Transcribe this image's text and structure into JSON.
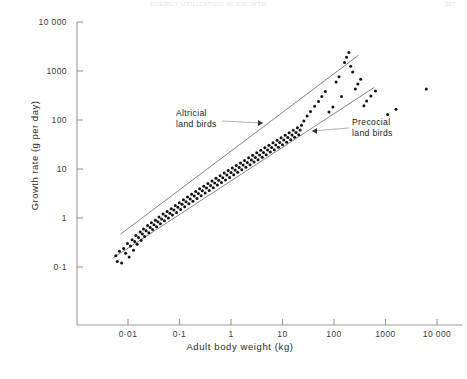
{
  "page": {
    "running_head": "ENERGY UTILIZATION IN GROWTH",
    "page_number": "227"
  },
  "chart_data": {
    "type": "scatter",
    "title": "",
    "xlabel": "Adult body weight (kg)",
    "ylabel": "Growth rate (g per day)",
    "xscale": "log",
    "yscale": "log",
    "xlim": [
      0.003,
      20000
    ],
    "ylim": [
      0.06,
      10000
    ],
    "grid": false,
    "legend": "none",
    "xticks": [
      "0·01",
      "0·1",
      "1",
      "10",
      "100",
      "1000",
      "10 000"
    ],
    "xtick_values": [
      0.01,
      0.1,
      1,
      10,
      100,
      1000,
      10000
    ],
    "yticks": [
      "0·1",
      "1",
      "10",
      "100",
      "1000",
      "10 000"
    ],
    "ytick_values": [
      0.1,
      1,
      10,
      100,
      1000,
      10000
    ],
    "annotations": [
      {
        "label": "Altricial\nland birds",
        "line1": "Altricial",
        "line2": "land birds",
        "target_series": "altricial-fit-line"
      },
      {
        "label": "Precocial\nland birds",
        "line1": "Precocial",
        "line2": "land birds",
        "target_series": "precocial-fit-line"
      }
    ],
    "series": [
      {
        "name": "Altricial land birds fit",
        "type": "line",
        "x": [
          0.0072,
          300
        ],
        "y": [
          0.47,
          2100
        ]
      },
      {
        "name": "Precocial land birds fit",
        "type": "line",
        "x": [
          0.0052,
          600
        ],
        "y": [
          0.155,
          460
        ]
      },
      {
        "name": "Bird species",
        "type": "scatter",
        "marker": "filled-circle",
        "n_points": 162,
        "points": [
          [
            0.0058,
            0.17
          ],
          [
            0.0062,
            0.13
          ],
          [
            0.0068,
            0.21
          ],
          [
            0.0075,
            0.12
          ],
          [
            0.0082,
            0.24
          ],
          [
            0.009,
            0.19
          ],
          [
            0.0098,
            0.3
          ],
          [
            0.0105,
            0.16
          ],
          [
            0.0112,
            0.27
          ],
          [
            0.012,
            0.36
          ],
          [
            0.0128,
            0.22
          ],
          [
            0.0135,
            0.33
          ],
          [
            0.0142,
            0.44
          ],
          [
            0.015,
            0.29
          ],
          [
            0.016,
            0.4
          ],
          [
            0.0172,
            0.52
          ],
          [
            0.018,
            0.35
          ],
          [
            0.019,
            0.47
          ],
          [
            0.02,
            0.6
          ],
          [
            0.021,
            0.42
          ],
          [
            0.0225,
            0.55
          ],
          [
            0.024,
            0.7
          ],
          [
            0.0255,
            0.5
          ],
          [
            0.027,
            0.64
          ],
          [
            0.0285,
            0.8
          ],
          [
            0.03,
            0.58
          ],
          [
            0.032,
            0.73
          ],
          [
            0.034,
            0.9
          ],
          [
            0.036,
            0.66
          ],
          [
            0.038,
            0.84
          ],
          [
            0.04,
            1.05
          ],
          [
            0.0425,
            0.76
          ],
          [
            0.045,
            0.95
          ],
          [
            0.048,
            1.2
          ],
          [
            0.051,
            0.88
          ],
          [
            0.054,
            1.1
          ],
          [
            0.0575,
            1.35
          ],
          [
            0.061,
            1.0
          ],
          [
            0.065,
            1.25
          ],
          [
            0.069,
            1.55
          ],
          [
            0.073,
            1.15
          ],
          [
            0.078,
            1.45
          ],
          [
            0.083,
            1.8
          ],
          [
            0.088,
            1.3
          ],
          [
            0.093,
            1.65
          ],
          [
            0.099,
            2.05
          ],
          [
            0.105,
            1.5
          ],
          [
            0.112,
            1.9
          ],
          [
            0.119,
            2.35
          ],
          [
            0.126,
            1.7
          ],
          [
            0.134,
            2.15
          ],
          [
            0.143,
            2.7
          ],
          [
            0.152,
            1.95
          ],
          [
            0.161,
            2.45
          ],
          [
            0.172,
            3.05
          ],
          [
            0.182,
            2.2
          ],
          [
            0.194,
            2.8
          ],
          [
            0.206,
            3.45
          ],
          [
            0.219,
            2.5
          ],
          [
            0.233,
            3.15
          ],
          [
            0.247,
            3.95
          ],
          [
            0.263,
            2.85
          ],
          [
            0.279,
            3.6
          ],
          [
            0.297,
            4.45
          ],
          [
            0.315,
            3.25
          ],
          [
            0.335,
            4.1
          ],
          [
            0.356,
            5.05
          ],
          [
            0.378,
            3.65
          ],
          [
            0.402,
            4.6
          ],
          [
            0.427,
            5.7
          ],
          [
            0.454,
            4.15
          ],
          [
            0.482,
            5.2
          ],
          [
            0.512,
            6.45
          ],
          [
            0.544,
            4.7
          ],
          [
            0.578,
            5.9
          ],
          [
            0.614,
            7.3
          ],
          [
            0.653,
            5.3
          ],
          [
            0.693,
            6.65
          ],
          [
            0.737,
            8.25
          ],
          [
            0.783,
            6.0
          ],
          [
            0.832,
            7.5
          ],
          [
            0.884,
            9.3
          ],
          [
            0.939,
            6.75
          ],
          [
            0.998,
            8.45
          ],
          [
            1.06,
            10.5
          ],
          [
            1.13,
            7.6
          ],
          [
            1.2,
            9.5
          ],
          [
            1.27,
            11.8
          ],
          [
            1.35,
            8.55
          ],
          [
            1.44,
            10.7
          ],
          [
            1.53,
            13.3
          ],
          [
            1.62,
            9.65
          ],
          [
            1.72,
            12.1
          ],
          [
            1.83,
            15.0
          ],
          [
            1.95,
            10.9
          ],
          [
            2.07,
            13.6
          ],
          [
            2.2,
            16.9
          ],
          [
            2.34,
            12.2
          ],
          [
            2.48,
            15.3
          ],
          [
            2.64,
            19.0
          ],
          [
            2.8,
            13.8
          ],
          [
            2.98,
            17.2
          ],
          [
            3.16,
            21.4
          ],
          [
            3.36,
            15.5
          ],
          [
            3.57,
            19.4
          ],
          [
            3.79,
            24.1
          ],
          [
            4.03,
            17.4
          ],
          [
            4.28,
            21.8
          ],
          [
            4.55,
            27.1
          ],
          [
            4.83,
            19.6
          ],
          [
            5.13,
            24.5
          ],
          [
            5.45,
            30.5
          ],
          [
            5.79,
            22.1
          ],
          [
            6.15,
            27.6
          ],
          [
            6.54,
            34.3
          ],
          [
            6.94,
            24.8
          ],
          [
            7.38,
            31.0
          ],
          [
            7.84,
            38.6
          ],
          [
            8.32,
            27.9
          ],
          [
            8.84,
            34.9
          ],
          [
            9.4,
            43.4
          ],
          [
            9.98,
            31.4
          ],
          [
            10.6,
            39.2
          ],
          [
            11.3,
            48.8
          ],
          [
            12.0,
            35.3
          ],
          [
            12.7,
            44.1
          ],
          [
            13.5,
            54.9
          ],
          [
            14.4,
            39.7
          ],
          [
            15.3,
            49.6
          ],
          [
            16.2,
            61.7
          ],
          [
            17.2,
            44.6
          ],
          [
            18.3,
            55.8
          ],
          [
            19.5,
            69.4
          ],
          [
            20.7,
            50.2
          ],
          [
            22.0,
            62.7
          ],
          [
            23.4,
            78.0
          ],
          [
            26.0,
            95.0
          ],
          [
            30.0,
            120
          ],
          [
            35.0,
            150
          ],
          [
            42.0,
            190
          ],
          [
            50.0,
            240
          ],
          [
            58.0,
            300
          ],
          [
            68.0,
            380
          ],
          [
            80.0,
            145
          ],
          [
            95.0,
            185
          ],
          [
            110,
            600
          ],
          [
            125,
            760
          ],
          [
            140,
            300
          ],
          [
            160,
            1500
          ],
          [
            175,
            1900
          ],
          [
            195,
            2400
          ],
          [
            210,
            1250
          ],
          [
            230,
            950
          ],
          [
            260,
            430
          ],
          [
            290,
            540
          ],
          [
            330,
            680
          ],
          [
            380,
            195
          ],
          [
            430,
            245
          ],
          [
            520,
            310
          ],
          [
            640,
            390
          ],
          [
            1100,
            130
          ],
          [
            1600,
            165
          ],
          [
            6200,
            430
          ]
        ]
      }
    ]
  },
  "axes": {
    "y_title": "Growth rate (g per day)",
    "x_title": "Adult body weight (kg)"
  }
}
